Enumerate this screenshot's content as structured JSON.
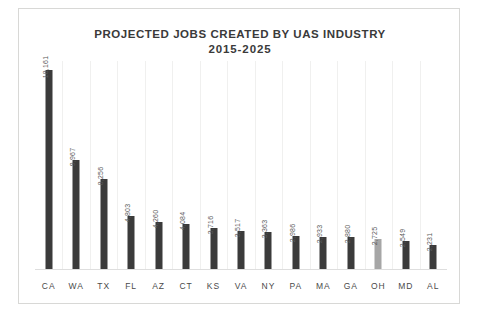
{
  "chart_data": {
    "type": "bar",
    "title": "PROJECTED JOBS CREATED BY UAS INDUSTRY",
    "subtitle": "2015-2025",
    "xlabel": "",
    "ylabel": "",
    "grid": "vertical-category-separators",
    "legend": "none",
    "ylim": [
      0,
      19000
    ],
    "categories": [
      "CA",
      "WA",
      "TX",
      "FL",
      "AZ",
      "CT",
      "KS",
      "VA",
      "NY",
      "PA",
      "MA",
      "GA",
      "OH",
      "MD",
      "AL"
    ],
    "values": [
      18161,
      9967,
      8256,
      4803,
      4260,
      4084,
      3716,
      3517,
      3363,
      2986,
      2933,
      2880,
      2725,
      2549,
      2231
    ],
    "value_labels": [
      "18,161",
      "9,967",
      "8,256",
      "4,803",
      "4,260",
      "4,084",
      "3,716",
      "3,517",
      "3,363",
      "2,986",
      "2,933",
      "2,880",
      "2,725",
      "2,549",
      "2,231"
    ],
    "highlighted_category": "OH",
    "colors": {
      "bar": "#3b3b3b",
      "bar_highlight": "#a6a6a6",
      "title": "#3a3a3a",
      "label": "#5a5a5a",
      "axis": "#dedede",
      "gridline": "#f0f0ef",
      "frame": "#d8d8d6",
      "background": "#ffffff"
    }
  }
}
